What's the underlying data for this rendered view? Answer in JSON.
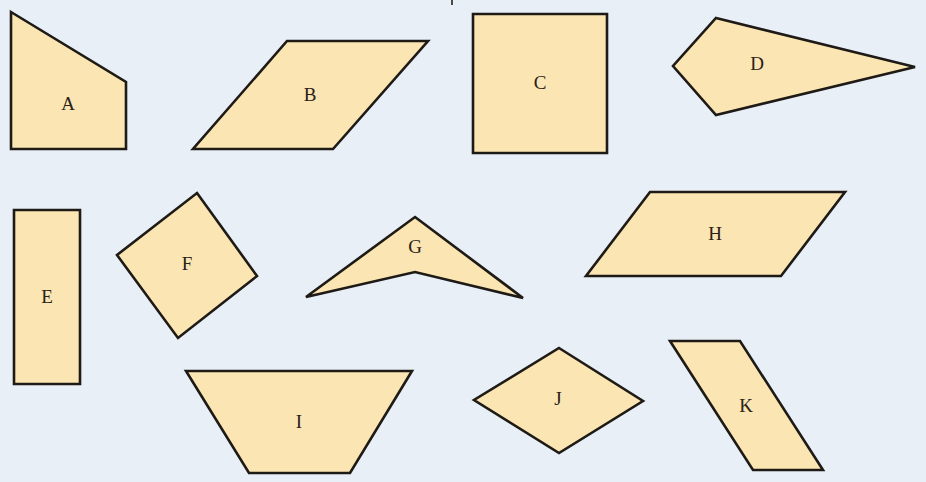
{
  "colors": {
    "background": "#e9eff6",
    "fill": "#fbe6b3",
    "stroke": "#1e1a16",
    "label": "#2a2118"
  },
  "shapes": [
    {
      "id": "A",
      "label": "A",
      "kind": "quadrilateral (right trapezoid)",
      "points": [
        [
          11,
          12
        ],
        [
          126,
          82
        ],
        [
          126,
          149
        ],
        [
          11,
          149
        ]
      ],
      "label_pos": [
        68,
        106
      ]
    },
    {
      "id": "B",
      "label": "B",
      "kind": "parallelogram",
      "points": [
        [
          287,
          41
        ],
        [
          428,
          41
        ],
        [
          333,
          149
        ],
        [
          193,
          149
        ]
      ],
      "label_pos": [
        310,
        97
      ]
    },
    {
      "id": "C",
      "label": "C",
      "kind": "square",
      "points": [
        [
          473,
          14
        ],
        [
          607,
          14
        ],
        [
          607,
          153
        ],
        [
          473,
          153
        ]
      ],
      "label_pos": [
        540,
        85
      ]
    },
    {
      "id": "D",
      "label": "D",
      "kind": "kite",
      "points": [
        [
          716,
          18
        ],
        [
          915,
          67
        ],
        [
          716,
          115
        ],
        [
          673,
          66
        ]
      ],
      "label_pos": [
        757,
        66
      ]
    },
    {
      "id": "E",
      "label": "E",
      "kind": "rectangle",
      "points": [
        [
          14,
          210
        ],
        [
          80,
          210
        ],
        [
          80,
          384
        ],
        [
          14,
          384
        ]
      ],
      "label_pos": [
        47,
        299
      ]
    },
    {
      "id": "F",
      "label": "F",
      "kind": "square (rotated)",
      "points": [
        [
          197,
          193
        ],
        [
          257,
          276
        ],
        [
          178,
          338
        ],
        [
          117,
          255
        ]
      ],
      "label_pos": [
        187,
        266
      ]
    },
    {
      "id": "G",
      "label": "G",
      "kind": "concave quadrilateral (dart)",
      "points": [
        [
          415,
          217
        ],
        [
          523,
          298
        ],
        [
          415,
          272
        ],
        [
          306,
          297
        ]
      ],
      "label_pos": [
        415,
        249
      ]
    },
    {
      "id": "H",
      "label": "H",
      "kind": "parallelogram",
      "points": [
        [
          650,
          192
        ],
        [
          845,
          192
        ],
        [
          781,
          276
        ],
        [
          586,
          276
        ]
      ],
      "label_pos": [
        715,
        236
      ]
    },
    {
      "id": "I",
      "label": "I",
      "kind": "trapezoid",
      "points": [
        [
          186,
          371
        ],
        [
          412,
          371
        ],
        [
          350,
          473
        ],
        [
          249,
          473
        ]
      ],
      "label_pos": [
        299,
        424
      ]
    },
    {
      "id": "J",
      "label": "J",
      "kind": "rhombus",
      "points": [
        [
          559,
          348
        ],
        [
          643,
          401
        ],
        [
          559,
          453
        ],
        [
          474,
          400
        ]
      ],
      "label_pos": [
        558,
        401
      ]
    },
    {
      "id": "K",
      "label": "K",
      "kind": "parallelogram",
      "points": [
        [
          670,
          341
        ],
        [
          740,
          341
        ],
        [
          823,
          470
        ],
        [
          753,
          470
        ]
      ],
      "label_pos": [
        746,
        408
      ]
    }
  ]
}
